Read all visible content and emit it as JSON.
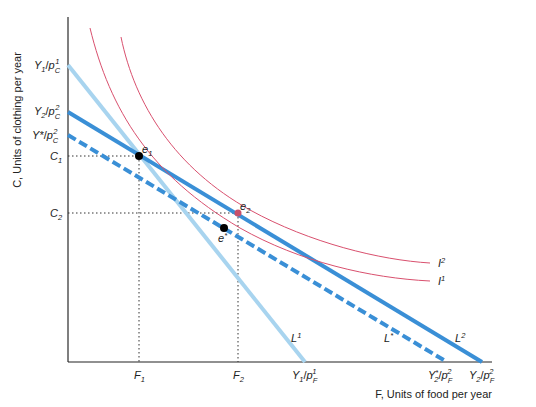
{
  "diagram": {
    "y_axis_title": "C, Units of clothing per year",
    "x_axis_title": "F, Units of food per year",
    "y_ticks": [
      {
        "id": "y1_pc1",
        "base": "Y",
        "base_sub": "1",
        "price": "p",
        "price_sub": "C",
        "price_sup": "1"
      },
      {
        "id": "y2_pc2",
        "base": "Y",
        "base_sub": "2",
        "price": "p",
        "price_sub": "C",
        "price_sup": "2"
      },
      {
        "id": "ystar_pc2",
        "base": "Y*",
        "base_sub": "",
        "price": "p",
        "price_sub": "C",
        "price_sup": "2"
      },
      {
        "id": "c1",
        "label": "C",
        "sub": "1"
      },
      {
        "id": "c2",
        "label": "C",
        "sub": "2"
      }
    ],
    "x_ticks": [
      {
        "id": "f1",
        "label": "F",
        "sub": "1"
      },
      {
        "id": "f2",
        "label": "F",
        "sub": "2"
      },
      {
        "id": "y1_pf1",
        "base": "Y",
        "base_sub": "1",
        "price": "p",
        "price_sub": "F",
        "price_sup": "1"
      },
      {
        "id": "y2star_pf2",
        "base": "Y",
        "base_sub": "2",
        "base_sup": "*",
        "price": "p",
        "price_sub": "F",
        "price_sup": "2"
      },
      {
        "id": "y2_pf2",
        "base": "Y",
        "base_sub": "2",
        "price": "p",
        "price_sub": "F",
        "price_sup": "2"
      }
    ],
    "lines": [
      {
        "id": "L1",
        "label": "L",
        "sup": "1",
        "style": "solid",
        "color": "#a8d4ef"
      },
      {
        "id": "L2",
        "label": "L",
        "sup": "2",
        "style": "solid",
        "color": "#3a8fd6"
      },
      {
        "id": "Lstar",
        "label": "L",
        "sup": "*",
        "style": "dashed",
        "color": "#3a8fd6"
      }
    ],
    "indifference_curves": [
      {
        "id": "I1",
        "label": "I",
        "sup": "1",
        "color": "#d9506e"
      },
      {
        "id": "I2",
        "label": "I",
        "sup": "2",
        "color": "#d9506e"
      }
    ],
    "points": [
      {
        "id": "e1",
        "label": "e",
        "sub": "1",
        "color": "#000000"
      },
      {
        "id": "e2",
        "label": "e",
        "sub": "2",
        "color": "#c8506a"
      },
      {
        "id": "estar",
        "label": "e",
        "sup": "*",
        "color": "#000000"
      }
    ]
  }
}
